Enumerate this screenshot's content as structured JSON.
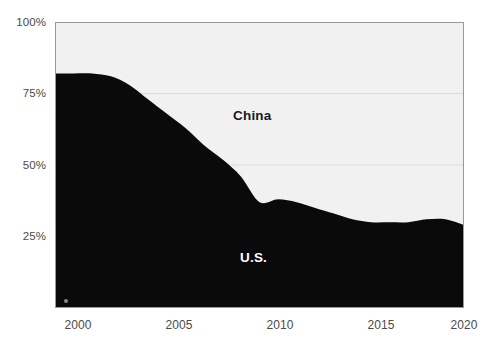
{
  "chart_data": {
    "type": "area",
    "title": "",
    "subtitle": "",
    "xlabel": "",
    "ylabel": "",
    "stacked": true,
    "normalized_percent": true,
    "grid": true,
    "legend_position": "inline-annotation",
    "xlim": [
      1999,
      2021
    ],
    "ylim": [
      0,
      100
    ],
    "y_ticks": [
      0,
      25,
      50,
      75,
      100
    ],
    "y_tick_labels": [
      "0%",
      "25%",
      "50%",
      "75%",
      "100%"
    ],
    "y_tick_labels_shown": [
      "25%",
      "50%",
      "75%",
      "100%"
    ],
    "x_ticks": [
      2000,
      2005,
      2010,
      2015,
      2020
    ],
    "x_tick_labels": [
      "2000",
      "2005",
      "2010",
      "2015",
      "2020"
    ],
    "x": [
      1999,
      2000,
      2001,
      2002,
      2003,
      2004,
      2005,
      2006,
      2007,
      2008,
      2009,
      2010,
      2011,
      2012,
      2013,
      2014,
      2015,
      2016,
      2017,
      2018,
      2019,
      2020,
      2021
    ],
    "series": [
      {
        "name": "U.S.",
        "color": "#0a0a0a",
        "label_color": "#ffffff",
        "values": [
          82,
          82,
          82,
          81,
          78,
          73,
          68,
          63,
          57,
          52,
          46,
          37,
          38,
          37,
          35,
          33,
          31,
          30,
          30,
          30,
          31,
          31,
          29
        ]
      },
      {
        "name": "China",
        "color": "#f1f1f1",
        "label_color": "#1a1a1a",
        "values": [
          18,
          18,
          18,
          19,
          22,
          27,
          32,
          37,
          43,
          48,
          54,
          63,
          62,
          63,
          65,
          67,
          69,
          70,
          70,
          70,
          69,
          69,
          71
        ]
      }
    ],
    "annotations": [
      {
        "text": "China",
        "x": 2012,
        "y": 68
      },
      {
        "text": "U.S.",
        "x": 2012,
        "y": 15
      }
    ]
  },
  "axes": {
    "y_labels": [
      {
        "text": "100%",
        "value": 100
      },
      {
        "text": "75%",
        "value": 75
      },
      {
        "text": "50%",
        "value": 50
      },
      {
        "text": "25%",
        "value": 25
      }
    ],
    "x_labels": [
      {
        "text": "2000",
        "value": 2000
      },
      {
        "text": "2005",
        "value": 2005
      },
      {
        "text": "2010",
        "value": 2010
      },
      {
        "text": "2015",
        "value": 2015
      },
      {
        "text": "2020",
        "value": 2020
      }
    ]
  },
  "labels": {
    "china": "China",
    "us": "U.S."
  },
  "colors": {
    "us_area": "#0a0a0a",
    "china_area": "#f1f1f1",
    "grid": "#dcdcdc",
    "border": "#9a9a9a",
    "tick_text": "#4a4a4a",
    "page_background": "#ffffff"
  }
}
